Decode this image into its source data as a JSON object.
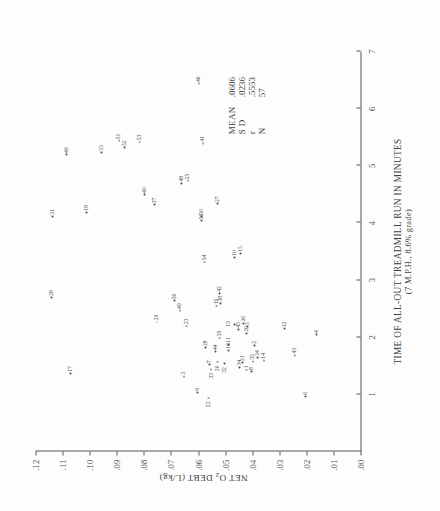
{
  "figure": {
    "x_axis": {
      "title_line1": "TIME OF ALL-OUT TREADMILL RUN IN MINUTES",
      "title_line2": "(7 M.P.H., 8.6% grade)",
      "ticks": [
        "1",
        "2",
        "3",
        "4",
        "5",
        "6",
        "7"
      ]
    },
    "y_axis": {
      "title_pre": "NET O",
      "title_sub": "2",
      "title_post": " DEBT (L/kg)",
      "ticks": [
        ".00",
        ".01",
        ".02",
        ".03",
        ".04",
        ".05",
        ".06",
        ".07",
        ".08",
        ".09",
        ".10",
        ".11",
        ".12"
      ]
    },
    "stats": [
      {
        "key": "MEAN",
        "value": ".0606"
      },
      {
        "key": "S D",
        "value": ".0236"
      },
      {
        "key": "r",
        "value": ".5553"
      },
      {
        "key": "N",
        "value": "57"
      }
    ]
  },
  "chart_data": {
    "type": "scatter",
    "title": "",
    "xlabel": "TIME OF ALL-OUT TREADMILL RUN IN MINUTES (7 M.P.H., 8.6% grade)",
    "ylabel": "NET O2 DEBT (L/kg)",
    "xlim": [
      0,
      7
    ],
    "ylim": [
      0.0,
      0.12
    ],
    "grid": false,
    "legend": false,
    "point_label_field": "id",
    "statistics": {
      "mean": 0.0606,
      "sd": 0.0236,
      "r": 0.5553,
      "n": 57
    },
    "points": [
      {
        "id": "22",
        "x": 0.92,
        "y": 0.0565,
        "lp": "lp-l"
      },
      {
        "id": "9",
        "x": 1.02,
        "y": 0.0605,
        "lp": "lp-r"
      },
      {
        "id": "6",
        "x": 0.95,
        "y": 0.0205,
        "lp": "lp-r"
      },
      {
        "id": "3",
        "x": 1.3,
        "y": 0.0655,
        "lp": "lp-r"
      },
      {
        "id": "17",
        "x": 1.35,
        "y": 0.1075,
        "lp": "lp-r"
      },
      {
        "id": "33",
        "x": 1.42,
        "y": 0.0555,
        "lp": "lp-l"
      },
      {
        "id": "7",
        "x": 1.5,
        "y": 0.056,
        "lp": "lp-r"
      },
      {
        "id": "30",
        "x": 1.55,
        "y": 0.053,
        "lp": "lp-l"
      },
      {
        "id": "34",
        "x": 1.46,
        "y": 0.045,
        "lp": "lp-r"
      },
      {
        "id": "1",
        "x": 1.41,
        "y": 0.0425,
        "lp": "lp-r"
      },
      {
        "id": "21",
        "x": 1.54,
        "y": 0.044,
        "lp": "lp-r"
      },
      {
        "id": "8",
        "x": 1.38,
        "y": 0.0405,
        "lp": "lp-r"
      },
      {
        "id": "35",
        "x": 1.56,
        "y": 0.04,
        "lp": "lp-r"
      },
      {
        "id": "24",
        "x": 1.63,
        "y": 0.0385,
        "lp": "lp-r"
      },
      {
        "id": "14",
        "x": 1.58,
        "y": 0.036,
        "lp": "lp-r"
      },
      {
        "id": "43",
        "x": 1.67,
        "y": 0.0245,
        "lp": "lp-r"
      },
      {
        "id": "44",
        "x": 1.73,
        "y": 0.054,
        "lp": "lp-r"
      },
      {
        "id": "28",
        "x": 1.8,
        "y": 0.0575,
        "lp": "lp-r"
      },
      {
        "id": "16",
        "x": 1.75,
        "y": 0.049,
        "lp": "lp-r"
      },
      {
        "id": "11",
        "x": 1.86,
        "y": 0.049,
        "lp": "lp-r"
      },
      {
        "id": "2",
        "x": 1.84,
        "y": 0.0395,
        "lp": "lp-r"
      },
      {
        "id": "39",
        "x": 1.97,
        "y": 0.0525,
        "lp": "lp-r"
      },
      {
        "id": "4",
        "x": 2.03,
        "y": 0.0165,
        "lp": "lp-r"
      },
      {
        "id": "20",
        "x": 2.05,
        "y": 0.0425,
        "lp": "lp-r"
      },
      {
        "id": "12",
        "x": 2.13,
        "y": 0.0285,
        "lp": "lp-r"
      },
      {
        "id": "45",
        "x": 2.12,
        "y": 0.0455,
        "lp": "lp-r"
      },
      {
        "id": "13",
        "x": 2.2,
        "y": 0.047,
        "lp": "lp-t"
      },
      {
        "id": "5",
        "x": 2.17,
        "y": 0.042,
        "lp": "lp-r"
      },
      {
        "id": "23",
        "x": 2.18,
        "y": 0.0645,
        "lp": "lp-r"
      },
      {
        "id": "26",
        "x": 2.23,
        "y": 0.0435,
        "lp": "lp-r"
      },
      {
        "id": "29",
        "x": 2.25,
        "y": 0.0755,
        "lp": "lp-r"
      },
      {
        "id": "49",
        "x": 2.45,
        "y": 0.067,
        "lp": "lp-r"
      },
      {
        "id": "19",
        "x": 2.53,
        "y": 0.0535,
        "lp": "lp-r"
      },
      {
        "id": "38",
        "x": 2.58,
        "y": 0.052,
        "lp": "lp-r"
      },
      {
        "id": "36",
        "x": 2.62,
        "y": 0.069,
        "lp": "lp-r"
      },
      {
        "id": "42",
        "x": 2.75,
        "y": 0.0525,
        "lp": "lp-r"
      },
      {
        "id": "28b",
        "x": 2.68,
        "y": 0.1145,
        "lp": "lp-r"
      },
      {
        "id": "54",
        "x": 3.3,
        "y": 0.058,
        "lp": "lp-r"
      },
      {
        "id": "10",
        "x": 3.38,
        "y": 0.047,
        "lp": "lp-r"
      },
      {
        "id": "15",
        "x": 3.45,
        "y": 0.0445,
        "lp": "lp-r"
      },
      {
        "id": "31",
        "x": 4.1,
        "y": 0.114,
        "lp": "lp-r"
      },
      {
        "id": "18",
        "x": 4.17,
        "y": 0.1015,
        "lp": "lp-r"
      },
      {
        "id": "56",
        "x": 4.02,
        "y": 0.059,
        "lp": "lp-r"
      },
      {
        "id": "50",
        "x": 4.1,
        "y": 0.059,
        "lp": "lp-r"
      },
      {
        "id": "37",
        "x": 4.3,
        "y": 0.0765,
        "lp": "lp-r"
      },
      {
        "id": "27",
        "x": 4.32,
        "y": 0.053,
        "lp": "lp-r"
      },
      {
        "id": "40",
        "x": 4.48,
        "y": 0.08,
        "lp": "lp-r"
      },
      {
        "id": "25",
        "x": 4.72,
        "y": 0.064,
        "lp": "lp-r"
      },
      {
        "id": "48",
        "x": 4.68,
        "y": 0.0665,
        "lp": "lp-r"
      },
      {
        "id": "46b",
        "x": 5.18,
        "y": 0.109,
        "lp": "lp-r"
      },
      {
        "id": "55",
        "x": 5.22,
        "y": 0.096,
        "lp": "lp-r"
      },
      {
        "id": "52",
        "x": 5.3,
        "y": 0.0875,
        "lp": "lp-r"
      },
      {
        "id": "51",
        "x": 5.42,
        "y": 0.0895,
        "lp": "lp-r"
      },
      {
        "id": "53",
        "x": 5.4,
        "y": 0.082,
        "lp": "lp-r"
      },
      {
        "id": "41",
        "x": 5.38,
        "y": 0.0585,
        "lp": "lp-r"
      },
      {
        "id": "46",
        "x": 6.42,
        "y": 0.06,
        "lp": "lp-r"
      },
      {
        "id": "32",
        "x": 1.52,
        "y": 0.0505,
        "lp": "lp-l"
      }
    ]
  }
}
